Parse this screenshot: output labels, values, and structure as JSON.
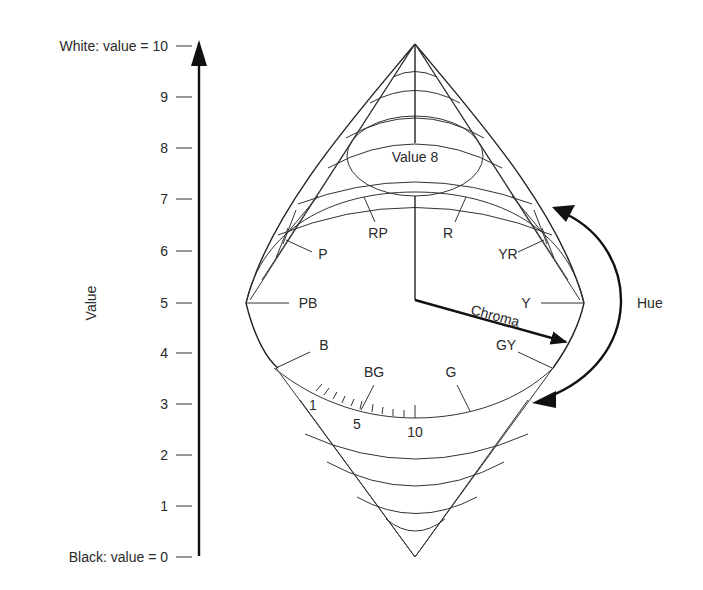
{
  "value_axis": {
    "title": "Value",
    "top_label": "White:  value = 10",
    "bottom_label": "Black:  value = 0",
    "ticks": [
      "9",
      "8",
      "7",
      "6",
      "5",
      "4",
      "3",
      "2",
      "1"
    ]
  },
  "solid": {
    "top_plane_label": "Value 8",
    "hues": {
      "RP": "RP",
      "R": "R",
      "YR": "YR",
      "Y": "Y",
      "GY": "GY",
      "G": "G",
      "BG": "BG",
      "B": "B",
      "PB": "PB",
      "P": "P"
    },
    "chroma_label": "Chroma",
    "chroma_scale": [
      "1",
      "5",
      "10"
    ],
    "hue_label": "Hue"
  },
  "colors": {
    "ink": "#222222",
    "background": "#ffffff"
  }
}
